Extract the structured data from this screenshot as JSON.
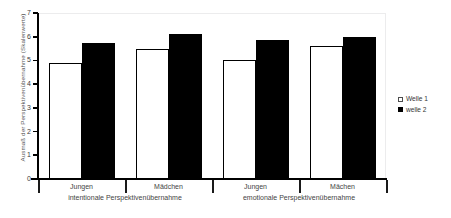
{
  "chart_data": {
    "type": "bar",
    "title": "",
    "xlabel": "",
    "ylabel": "Ausmaß der Perspektivenübernahme (Skalenwerte)",
    "ylim": [
      0,
      7
    ],
    "yticks": [
      "0",
      "1",
      "2",
      "3",
      "4",
      "5",
      "6",
      "7"
    ],
    "grid": false,
    "legend_position": "right",
    "categories": [
      "Jungen",
      "Mädchen",
      "Jungen",
      "Mächen"
    ],
    "group_labels": [
      "intentionale Perspektivenübernahme",
      "emotionale Perspektivenübernahme"
    ],
    "series": [
      {
        "name": "Welle 1",
        "color": "#ffffff",
        "values": [
          4.9,
          5.5,
          5.0,
          5.6
        ]
      },
      {
        "name": "welle 2",
        "color": "#000000",
        "values": [
          5.75,
          6.1,
          5.85,
          6.0
        ]
      }
    ]
  },
  "legend": {
    "items": [
      {
        "label": "Welle 1",
        "swatch": "white-square-icon"
      },
      {
        "label": "welle 2",
        "swatch": "black-square-icon"
      }
    ]
  }
}
